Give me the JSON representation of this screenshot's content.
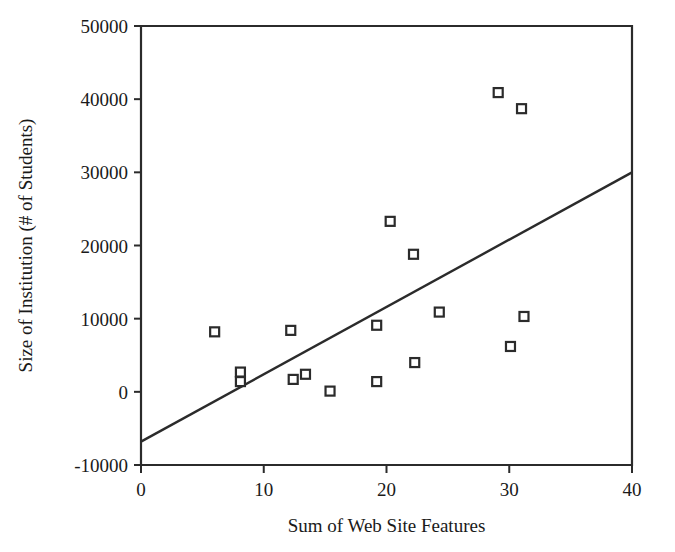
{
  "chart_data": {
    "type": "scatter",
    "title": "",
    "xlabel": "Sum of Web Site Features",
    "ylabel": "Size of Institution (# of Students)",
    "xlim": [
      0,
      40
    ],
    "ylim": [
      -10000,
      50000
    ],
    "xticks": [
      "0",
      "10",
      "20",
      "30",
      "40"
    ],
    "xtick_values": [
      0,
      10,
      20,
      30,
      40
    ],
    "yticks": [
      "-10000",
      "0",
      "10000",
      "20000",
      "30000",
      "40000",
      "50000"
    ],
    "ytick_values": [
      -10000,
      0,
      10000,
      20000,
      30000,
      40000,
      50000
    ],
    "grid": false,
    "legend": false,
    "marker": "open-square",
    "marker_color": "#2b2b2b",
    "series": [
      {
        "name": "Institutions",
        "points": [
          {
            "x": 6.0,
            "y": 8200
          },
          {
            "x": 8.1,
            "y": 2700
          },
          {
            "x": 8.1,
            "y": 1400
          },
          {
            "x": 12.2,
            "y": 8400
          },
          {
            "x": 12.4,
            "y": 1700
          },
          {
            "x": 13.4,
            "y": 2400
          },
          {
            "x": 15.4,
            "y": 100
          },
          {
            "x": 19.2,
            "y": 9100
          },
          {
            "x": 19.2,
            "y": 1400
          },
          {
            "x": 20.3,
            "y": 23300
          },
          {
            "x": 22.2,
            "y": 18800
          },
          {
            "x": 22.3,
            "y": 4000
          },
          {
            "x": 24.3,
            "y": 10900
          },
          {
            "x": 29.1,
            "y": 40900
          },
          {
            "x": 30.1,
            "y": 6200
          },
          {
            "x": 31.0,
            "y": 38700
          },
          {
            "x": 31.2,
            "y": 10300
          }
        ]
      }
    ],
    "trendline": {
      "name": "Linear fit",
      "x0": 0,
      "y0": -6800,
      "x1": 40,
      "y1": 30000,
      "color": "#2b2b2b"
    }
  }
}
